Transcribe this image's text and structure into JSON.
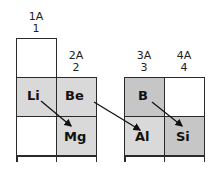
{
  "groups": [
    {
      "label": "1A",
      "number": "1"
    },
    {
      "label": "2A",
      "number": "2"
    },
    {
      "label": "3A",
      "number": "3"
    },
    {
      "label": "4A",
      "number": "4"
    }
  ],
  "elements": {
    "li": "Li",
    "be": "Be",
    "mg": "Mg",
    "b": "B",
    "al": "Al",
    "si": "Si"
  },
  "colors": {
    "light_gray": "#d9d9d9",
    "dark_gray": "#c6c6c6",
    "empty": "#ffffff",
    "border": "#2a2a2a"
  },
  "relationships": [
    {
      "from": "Li",
      "to": "Mg",
      "type": "diagonal"
    },
    {
      "from": "Be",
      "to": "Al",
      "type": "diagonal"
    },
    {
      "from": "B",
      "to": "Si",
      "type": "diagonal"
    }
  ]
}
